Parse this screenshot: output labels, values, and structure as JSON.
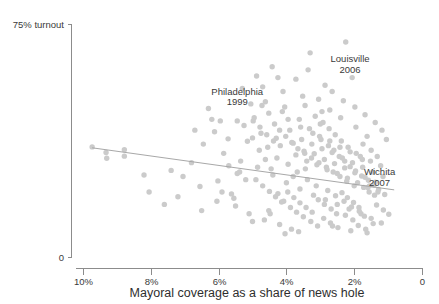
{
  "chart_data": {
    "type": "scatter",
    "title": "",
    "subtitle": "",
    "xlabel": "Mayoral coverage as a share of news hole",
    "ylabel": "75% turnout",
    "y_axis_top_label": "75% turnout",
    "y_axis_bottom_label": "0",
    "xlim": [
      10,
      0
    ],
    "ylim": [
      0,
      75
    ],
    "x_axis_reversed": true,
    "grid": false,
    "legend": "none",
    "xticks": [
      {
        "value": 10,
        "label": "10%"
      },
      {
        "value": 8,
        "label": "8%"
      },
      {
        "value": 6,
        "label": "6%"
      },
      {
        "value": 4,
        "label": "4%"
      },
      {
        "value": 2,
        "label": "2%"
      },
      {
        "value": 0,
        "label": "0"
      }
    ],
    "yticks": [
      {
        "value": 75,
        "label": "75% turnout"
      },
      {
        "value": 0,
        "label": "0"
      }
    ],
    "trend_line": {
      "name": "fitted trend",
      "x_start": 9.73,
      "y_start": 35.3,
      "x_end": 0.82,
      "y_end": 21.7
    },
    "annotations": [
      {
        "label_line1": "Philadelphia",
        "label_line2": "1999",
        "x": 5.45,
        "y": 52.5,
        "point_x": 5.45,
        "point_y": 44.0
      },
      {
        "label_line1": "Louisville",
        "label_line2": "2006",
        "x": 2.12,
        "y": 63.0,
        "point_x": 2.25,
        "point_y": 69.5
      },
      {
        "label_line1": "Wichita",
        "label_line2": "2007",
        "x": 1.25,
        "y": 26.5,
        "point_x": 1.55,
        "point_y": 23.0
      }
    ],
    "point_count": 232,
    "points": [
      [
        9.73,
        35.6
      ],
      [
        9.32,
        33.8
      ],
      [
        9.3,
        31.9
      ],
      [
        8.78,
        34.7
      ],
      [
        8.78,
        32.6
      ],
      [
        7.05,
        26.0
      ],
      [
        6.55,
        22.8
      ],
      [
        6.02,
        24.6
      ],
      [
        5.62,
        20.4
      ],
      [
        5.38,
        27.5
      ],
      [
        4.52,
        15.0
      ],
      [
        6.3,
        48.0
      ],
      [
        5.95,
        44.0
      ],
      [
        5.45,
        44.0
      ],
      [
        5.72,
        38.2
      ],
      [
        5.15,
        37.4
      ],
      [
        4.88,
        58.5
      ],
      [
        4.62,
        50.2
      ],
      [
        4.52,
        46.5
      ],
      [
        4.35,
        43.0
      ],
      [
        4.3,
        38.4
      ],
      [
        4.18,
        36.0
      ],
      [
        4.05,
        48.5
      ],
      [
        3.9,
        41.0
      ],
      [
        3.8,
        36.8
      ],
      [
        3.72,
        33.0
      ],
      [
        3.62,
        44.5
      ],
      [
        3.55,
        38.0
      ],
      [
        3.48,
        34.2
      ],
      [
        3.4,
        31.0
      ],
      [
        3.32,
        41.5
      ],
      [
        3.25,
        36.5
      ],
      [
        3.18,
        33.4
      ],
      [
        3.1,
        29.8
      ],
      [
        3.02,
        39.0
      ],
      [
        2.95,
        35.0
      ],
      [
        2.88,
        31.5
      ],
      [
        2.8,
        28.2
      ],
      [
        2.72,
        37.5
      ],
      [
        2.65,
        33.8
      ],
      [
        2.58,
        30.2
      ],
      [
        2.5,
        27.0
      ],
      [
        2.42,
        35.5
      ],
      [
        2.35,
        32.0
      ],
      [
        2.28,
        28.8
      ],
      [
        2.2,
        25.5
      ],
      [
        2.12,
        34.0
      ],
      [
        2.05,
        30.5
      ],
      [
        1.98,
        27.2
      ],
      [
        1.9,
        24.0
      ],
      [
        1.82,
        32.5
      ],
      [
        1.75,
        29.0
      ],
      [
        1.68,
        25.8
      ],
      [
        1.6,
        22.5
      ],
      [
        1.52,
        31.0
      ],
      [
        1.45,
        27.5
      ],
      [
        1.38,
        24.2
      ],
      [
        1.3,
        21.0
      ],
      [
        1.22,
        29.5
      ],
      [
        1.15,
        26.0
      ],
      [
        2.25,
        69.5
      ],
      [
        3.3,
        66.0
      ],
      [
        4.42,
        61.5
      ],
      [
        3.72,
        57.5
      ],
      [
        4.7,
        55.0
      ],
      [
        2.65,
        53.5
      ],
      [
        3.05,
        51.0
      ],
      [
        5.05,
        49.5
      ],
      [
        2.95,
        47.0
      ],
      [
        4.95,
        45.0
      ],
      [
        6.12,
        40.5
      ],
      [
        6.45,
        36.5
      ],
      [
        5.85,
        33.5
      ],
      [
        5.35,
        31.0
      ],
      [
        4.85,
        29.0
      ],
      [
        4.4,
        26.5
      ],
      [
        4.0,
        24.0
      ],
      [
        3.6,
        22.0
      ],
      [
        3.2,
        20.0
      ],
      [
        2.85,
        18.5
      ],
      [
        2.5,
        17.0
      ],
      [
        2.15,
        15.5
      ],
      [
        1.8,
        14.0
      ],
      [
        1.5,
        12.5
      ],
      [
        1.2,
        11.0
      ],
      [
        5.5,
        16.5
      ],
      [
        5.1,
        14.0
      ],
      [
        4.65,
        12.0
      ],
      [
        4.2,
        10.5
      ],
      [
        3.85,
        9.0
      ],
      [
        6.05,
        18.0
      ],
      [
        6.5,
        15.0
      ],
      [
        7.2,
        19.5
      ],
      [
        7.6,
        17.0
      ],
      [
        8.05,
        21.0
      ],
      [
        4.1,
        53.5
      ],
      [
        3.45,
        49.0
      ],
      [
        2.4,
        45.0
      ],
      [
        1.95,
        42.0
      ],
      [
        1.62,
        39.0
      ],
      [
        4.75,
        40.0
      ],
      [
        4.55,
        35.5
      ],
      [
        4.28,
        32.0
      ],
      [
        3.95,
        30.0
      ],
      [
        3.68,
        27.5
      ],
      [
        3.38,
        25.0
      ],
      [
        3.12,
        23.0
      ],
      [
        2.78,
        21.5
      ],
      [
        2.55,
        19.8
      ],
      [
        2.3,
        18.0
      ],
      [
        2.08,
        16.2
      ],
      [
        1.85,
        14.8
      ],
      [
        1.7,
        13.2
      ],
      [
        1.55,
        23.0
      ],
      [
        1.4,
        20.0
      ],
      [
        5.25,
        42.5
      ],
      [
        5.0,
        38.5
      ],
      [
        4.8,
        34.5
      ],
      [
        4.62,
        31.5
      ],
      [
        4.45,
        28.5
      ],
      [
        4.25,
        20.5
      ],
      [
        4.08,
        18.0
      ],
      [
        3.88,
        16.0
      ],
      [
        3.7,
        14.5
      ],
      [
        3.5,
        13.0
      ],
      [
        3.28,
        11.5
      ],
      [
        3.08,
        10.0
      ],
      [
        2.9,
        12.5
      ],
      [
        2.7,
        11.0
      ],
      [
        2.48,
        9.5
      ],
      [
        2.26,
        13.5
      ],
      [
        2.04,
        12.0
      ],
      [
        1.88,
        10.2
      ],
      [
        1.66,
        9.0
      ],
      [
        1.44,
        10.8
      ],
      [
        3.95,
        44.5
      ],
      [
        3.58,
        42.0
      ],
      [
        3.22,
        40.0
      ],
      [
        2.98,
        38.0
      ],
      [
        2.76,
        36.0
      ],
      [
        2.6,
        34.5
      ],
      [
        2.44,
        32.5
      ],
      [
        2.28,
        31.0
      ],
      [
        2.12,
        29.2
      ],
      [
        1.96,
        27.8
      ],
      [
        1.78,
        26.2
      ],
      [
        1.58,
        24.8
      ],
      [
        1.42,
        23.2
      ],
      [
        1.28,
        21.8
      ],
      [
        1.1,
        20.2
      ],
      [
        4.9,
        25.0
      ],
      [
        4.7,
        23.0
      ],
      [
        4.5,
        21.2
      ],
      [
        4.32,
        19.5
      ],
      [
        4.14,
        17.8
      ],
      [
        3.96,
        21.0
      ],
      [
        3.78,
        19.2
      ],
      [
        3.6,
        17.5
      ],
      [
        3.42,
        16.0
      ],
      [
        3.24,
        14.5
      ],
      [
        3.06,
        18.5
      ],
      [
        2.88,
        17.0
      ],
      [
        2.68,
        15.5
      ],
      [
        2.52,
        14.0
      ],
      [
        2.36,
        20.8
      ],
      [
        2.2,
        19.2
      ],
      [
        2.02,
        17.6
      ],
      [
        1.86,
        16.0
      ],
      [
        1.72,
        22.5
      ],
      [
        1.56,
        21.0
      ],
      [
        5.7,
        29.5
      ],
      [
        5.45,
        27.0
      ],
      [
        5.2,
        25.0
      ],
      [
        4.98,
        44.0
      ],
      [
        4.78,
        42.0
      ],
      [
        4.58,
        39.5
      ],
      [
        4.38,
        37.5
      ],
      [
        4.2,
        41.0
      ],
      [
        4.02,
        39.0
      ],
      [
        3.84,
        37.0
      ],
      [
        3.66,
        35.0
      ],
      [
        3.46,
        33.5
      ],
      [
        3.26,
        32.0
      ],
      [
        3.04,
        30.5
      ],
      [
        2.82,
        29.0
      ],
      [
        2.62,
        27.5
      ],
      [
        2.42,
        26.0
      ],
      [
        2.22,
        24.5
      ],
      [
        2.0,
        23.0
      ],
      [
        1.76,
        31.5
      ],
      [
        3.15,
        45.5
      ],
      [
        2.92,
        43.5
      ],
      [
        2.74,
        41.5
      ],
      [
        2.56,
        39.5
      ],
      [
        2.38,
        37.5
      ],
      [
        2.18,
        35.5
      ],
      [
        1.94,
        33.5
      ],
      [
        1.74,
        36.5
      ],
      [
        1.5,
        34.5
      ],
      [
        1.32,
        32.5
      ],
      [
        6.8,
        30.5
      ],
      [
        7.4,
        28.0
      ],
      [
        8.2,
        26.5
      ],
      [
        5.9,
        21.0
      ],
      [
        5.55,
        19.0
      ],
      [
        4.72,
        49.0
      ],
      [
        4.12,
        47.0
      ],
      [
        3.52,
        52.0
      ],
      [
        2.86,
        55.5
      ],
      [
        2.06,
        58.0
      ],
      [
        1.98,
        48.5
      ],
      [
        1.68,
        46.0
      ],
      [
        1.38,
        43.5
      ],
      [
        1.18,
        41.0
      ],
      [
        1.05,
        38.0
      ],
      [
        3.36,
        60.5
      ],
      [
        4.25,
        58.0
      ],
      [
        5.3,
        54.5
      ],
      [
        6.2,
        44.5
      ],
      [
        6.7,
        41.0
      ],
      [
        2.32,
        50.5
      ],
      [
        2.72,
        47.5
      ],
      [
        3.0,
        43.0
      ],
      [
        3.44,
        28.5
      ],
      [
        3.8,
        26.0
      ],
      [
        4.48,
        14.0
      ],
      [
        5.0,
        11.5
      ],
      [
        2.64,
        10.0
      ],
      [
        2.1,
        8.5
      ],
      [
        1.62,
        7.8
      ],
      [
        3.64,
        8.2
      ],
      [
        4.04,
        7.5
      ],
      [
        1.34,
        16.8
      ],
      [
        1.14,
        15.2
      ],
      [
        0.98,
        13.8
      ]
    ]
  },
  "caption": "Mayoral coverage as a share of news hole"
}
